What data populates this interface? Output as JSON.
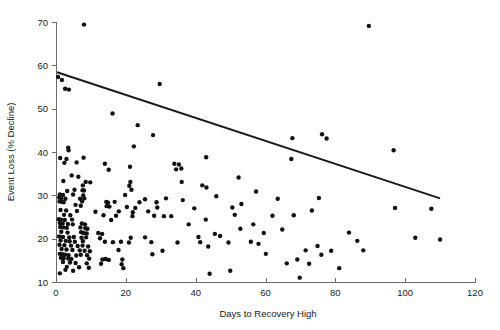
{
  "chart_data": {
    "type": "scatter",
    "title": "",
    "xlabel": "Days to Recovery High",
    "ylabel": "Event Loss (% Decline)",
    "xlim": [
      0,
      120
    ],
    "ylim": [
      10,
      70
    ],
    "xticks": [
      0,
      20,
      40,
      60,
      80,
      100,
      120
    ],
    "yticks": [
      10,
      20,
      30,
      40,
      50,
      60,
      70
    ],
    "xtick_labels": [
      "0",
      "20",
      "40",
      "60",
      "80",
      "100",
      "120"
    ],
    "ytick_labels": [
      "10",
      "20",
      "30",
      "40",
      "50",
      "60",
      "70"
    ],
    "grid": false,
    "legend": null,
    "marker_color": "#111111",
    "marker_size": 2.2,
    "trend_line": {
      "label": "linear fit",
      "color": "#1a1a1a",
      "x_start": 0.3,
      "y_start": 58.4,
      "x_end": 110.0,
      "y_end": 29.3
    },
    "series": [
      {
        "name": "events",
        "points": [
          [
            8.0,
            69.4
          ],
          [
            89.6,
            69.1
          ],
          [
            0.6,
            57.3
          ],
          [
            1.7,
            56.6
          ],
          [
            29.7,
            55.7
          ],
          [
            2.6,
            54.6
          ],
          [
            3.7,
            54.4
          ],
          [
            16.2,
            48.9
          ],
          [
            23.4,
            46.2
          ],
          [
            27.8,
            43.9
          ],
          [
            76.2,
            44.1
          ],
          [
            67.7,
            43.2
          ],
          [
            77.5,
            43.1
          ],
          [
            22.3,
            41.3
          ],
          [
            3.5,
            41.0
          ],
          [
            3.6,
            40.4
          ],
          [
            96.7,
            40.4
          ],
          [
            1.2,
            38.6
          ],
          [
            67.4,
            38.4
          ],
          [
            3.0,
            38.4
          ],
          [
            7.9,
            38.7
          ],
          [
            43.0,
            38.8
          ],
          [
            2.4,
            37.5
          ],
          [
            5.9,
            37.6
          ],
          [
            14.0,
            37.3
          ],
          [
            33.9,
            37.3
          ],
          [
            35.2,
            37.1
          ],
          [
            21.2,
            36.6
          ],
          [
            35.9,
            36.2
          ],
          [
            34.4,
            36.0
          ],
          [
            15.1,
            35.9
          ],
          [
            4.5,
            34.6
          ],
          [
            6.4,
            34.3
          ],
          [
            52.3,
            34.1
          ],
          [
            2.1,
            33.3
          ],
          [
            8.5,
            33.1
          ],
          [
            9.8,
            33.0
          ],
          [
            21.3,
            33.1
          ],
          [
            36.0,
            33.1
          ],
          [
            7.7,
            32.3
          ],
          [
            21.0,
            32.2
          ],
          [
            41.9,
            32.3
          ],
          [
            43.1,
            31.8
          ],
          [
            5.3,
            31.3
          ],
          [
            7.6,
            31.2
          ],
          [
            8.0,
            31.1
          ],
          [
            21.6,
            31.3
          ],
          [
            3.2,
            31.0
          ],
          [
            1.1,
            30.2
          ],
          [
            2.0,
            30.1
          ],
          [
            4.9,
            30.2
          ],
          [
            7.8,
            30.0
          ],
          [
            19.8,
            30.1
          ],
          [
            0.9,
            29.5
          ],
          [
            1.5,
            29.3
          ],
          [
            2.7,
            29.2
          ],
          [
            6.9,
            29.2
          ],
          [
            8.1,
            29.3
          ],
          [
            25.5,
            29.1
          ],
          [
            31.5,
            29.3
          ],
          [
            75.3,
            29.4
          ],
          [
            1.0,
            28.6
          ],
          [
            1.6,
            28.5
          ],
          [
            2.2,
            28.4
          ],
          [
            7.5,
            28.6
          ],
          [
            14.4,
            28.5
          ],
          [
            14.9,
            28.3
          ],
          [
            16.8,
            28.5
          ],
          [
            23.9,
            28.4
          ],
          [
            28.8,
            28.4
          ],
          [
            5.6,
            27.8
          ],
          [
            7.1,
            27.6
          ],
          [
            14.5,
            27.5
          ],
          [
            15.3,
            27.4
          ],
          [
            20.3,
            27.3
          ],
          [
            22.7,
            27.1
          ],
          [
            29.0,
            27.2
          ],
          [
            97.1,
            27.1
          ],
          [
            1.3,
            26.6
          ],
          [
            2.9,
            26.5
          ],
          [
            6.0,
            26.4
          ],
          [
            11.3,
            26.2
          ],
          [
            18.0,
            26.3
          ],
          [
            22.0,
            26.1
          ],
          [
            26.4,
            26.3
          ],
          [
            73.3,
            26.5
          ],
          [
            2.3,
            25.5
          ],
          [
            4.1,
            25.4
          ],
          [
            13.6,
            25.4
          ],
          [
            17.2,
            25.3
          ],
          [
            21.9,
            25.2
          ],
          [
            28.1,
            25.3
          ],
          [
            30.9,
            25.2
          ],
          [
            51.2,
            25.5
          ],
          [
            68.1,
            25.4
          ],
          [
            0.8,
            24.5
          ],
          [
            1.4,
            24.4
          ],
          [
            2.5,
            24.3
          ],
          [
            4.6,
            24.4
          ],
          [
            15.8,
            24.3
          ],
          [
            42.9,
            24.4
          ],
          [
            1.1,
            23.6
          ],
          [
            1.9,
            23.5
          ],
          [
            3.4,
            23.4
          ],
          [
            4.8,
            23.3
          ],
          [
            7.4,
            23.5
          ],
          [
            8.3,
            23.3
          ],
          [
            56.5,
            23.3
          ],
          [
            1.2,
            22.7
          ],
          [
            2.1,
            22.6
          ],
          [
            3.1,
            22.5
          ],
          [
            7.0,
            22.6
          ],
          [
            8.4,
            22.4
          ],
          [
            9.0,
            22.3
          ],
          [
            52.8,
            22.3
          ],
          [
            1.5,
            21.6
          ],
          [
            3.3,
            21.4
          ],
          [
            7.2,
            21.5
          ],
          [
            7.9,
            21.3
          ],
          [
            8.8,
            21.2
          ],
          [
            12.1,
            21.3
          ],
          [
            13.2,
            21.1
          ],
          [
            45.5,
            21.1
          ],
          [
            0.9,
            20.5
          ],
          [
            2.0,
            20.4
          ],
          [
            3.8,
            20.3
          ],
          [
            5.1,
            20.4
          ],
          [
            7.3,
            20.2
          ],
          [
            8.6,
            20.3
          ],
          [
            12.6,
            20.1
          ],
          [
            21.4,
            20.2
          ],
          [
            25.5,
            20.3
          ],
          [
            40.8,
            20.4
          ],
          [
            1.3,
            19.6
          ],
          [
            2.8,
            19.5
          ],
          [
            3.9,
            19.4
          ],
          [
            5.4,
            19.3
          ],
          [
            7.7,
            19.4
          ],
          [
            14.0,
            19.3
          ],
          [
            16.3,
            19.2
          ],
          [
            18.6,
            19.3
          ],
          [
            20.9,
            19.1
          ],
          [
            27.3,
            19.2
          ],
          [
            34.8,
            19.1
          ],
          [
            41.3,
            19.2
          ],
          [
            1.0,
            18.6
          ],
          [
            2.4,
            18.5
          ],
          [
            4.3,
            18.4
          ],
          [
            6.2,
            18.3
          ],
          [
            7.6,
            18.4
          ],
          [
            9.2,
            18.2
          ],
          [
            43.6,
            18.2
          ],
          [
            74.9,
            18.3
          ],
          [
            1.6,
            17.6
          ],
          [
            3.0,
            17.5
          ],
          [
            4.7,
            17.4
          ],
          [
            6.8,
            17.3
          ],
          [
            8.2,
            17.2
          ],
          [
            9.7,
            17.1
          ],
          [
            17.9,
            17.4
          ],
          [
            30.5,
            17.2
          ],
          [
            71.5,
            17.3
          ],
          [
            78.8,
            17.2
          ],
          [
            1.1,
            16.5
          ],
          [
            1.8,
            16.4
          ],
          [
            2.6,
            16.3
          ],
          [
            3.6,
            16.2
          ],
          [
            5.8,
            16.1
          ],
          [
            7.1,
            16.3
          ],
          [
            8.9,
            16.2
          ],
          [
            27.6,
            16.4
          ],
          [
            76.0,
            16.3
          ],
          [
            1.4,
            15.6
          ],
          [
            2.2,
            15.5
          ],
          [
            3.5,
            15.4
          ],
          [
            4.4,
            15.3
          ],
          [
            9.5,
            15.4
          ],
          [
            13.3,
            15.2
          ],
          [
            14.2,
            15.3
          ],
          [
            15.1,
            15.1
          ],
          [
            19.0,
            15.2
          ],
          [
            69.1,
            15.2
          ],
          [
            2.0,
            14.6
          ],
          [
            4.0,
            14.5
          ],
          [
            5.6,
            14.4
          ],
          [
            8.8,
            14.3
          ],
          [
            12.9,
            14.2
          ],
          [
            18.8,
            14.1
          ],
          [
            66.1,
            14.3
          ],
          [
            72.5,
            14.2
          ],
          [
            3.1,
            13.5
          ],
          [
            6.6,
            13.4
          ],
          [
            9.4,
            13.3
          ],
          [
            19.3,
            13.2
          ],
          [
            81.1,
            13.2
          ],
          [
            2.7,
            12.8
          ],
          [
            4.9,
            12.6
          ],
          [
            49.9,
            12.6
          ],
          [
            1.1,
            12.0
          ],
          [
            44.0,
            11.9
          ],
          [
            69.8,
            11.0
          ],
          [
            36.3,
            28.9
          ],
          [
            33.0,
            25.2
          ],
          [
            47.0,
            20.6
          ],
          [
            49.4,
            19.1
          ],
          [
            55.8,
            19.3
          ],
          [
            58.0,
            18.8
          ],
          [
            60.1,
            16.5
          ],
          [
            62.0,
            25.3
          ],
          [
            63.5,
            29.2
          ],
          [
            64.8,
            22.1
          ],
          [
            83.9,
            21.4
          ],
          [
            86.3,
            19.5
          ],
          [
            88.0,
            17.3
          ],
          [
            102.9,
            20.2
          ],
          [
            107.5,
            26.9
          ],
          [
            110.0,
            19.8
          ],
          [
            45.9,
            29.8
          ],
          [
            38.0,
            23.3
          ],
          [
            39.6,
            27.0
          ],
          [
            50.5,
            27.2
          ],
          [
            53.1,
            28.0
          ],
          [
            57.3,
            30.9
          ],
          [
            59.5,
            21.3
          ]
        ]
      }
    ]
  }
}
